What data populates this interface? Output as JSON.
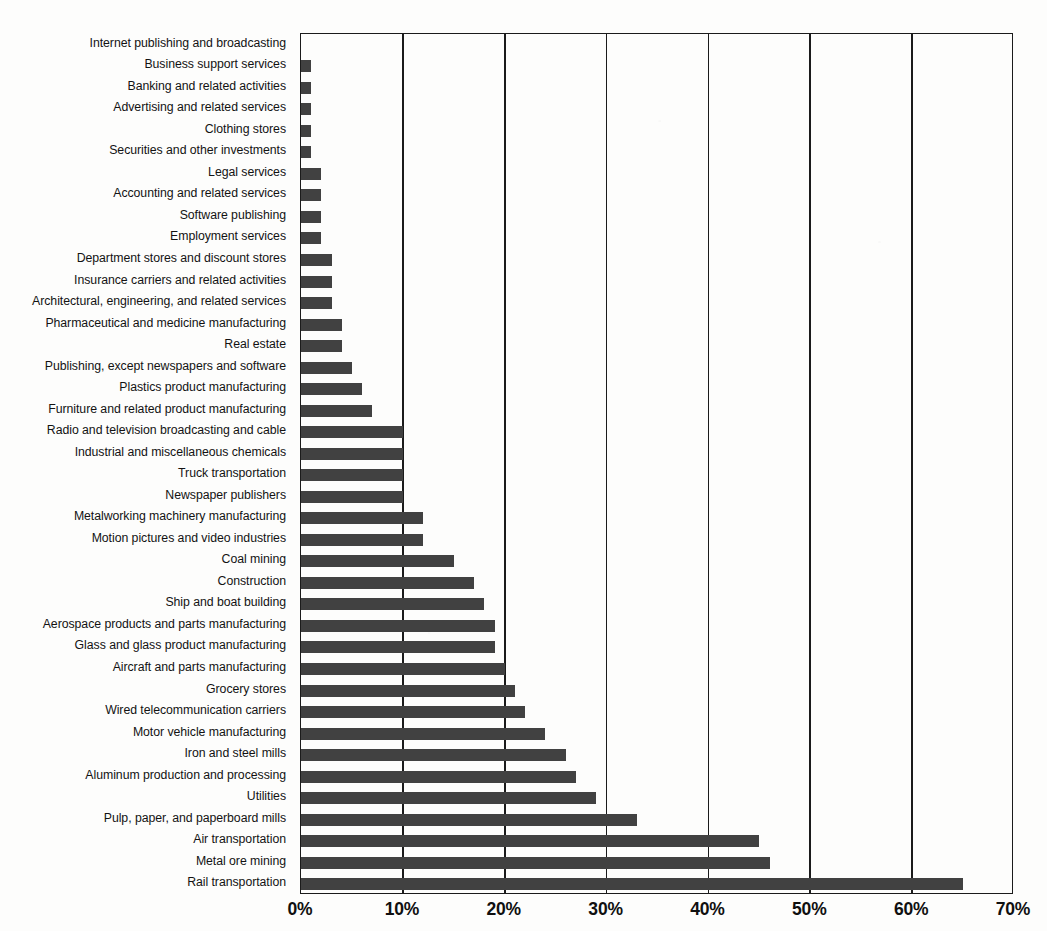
{
  "chart_data": {
    "type": "bar",
    "orientation": "horizontal",
    "title": "",
    "subtitle": "",
    "xlabel": "",
    "ylabel": "",
    "xlim": [
      0,
      70
    ],
    "ylim": null,
    "grid": true,
    "grid_axis": "x",
    "legend": null,
    "legend_position": "none",
    "value_unit": "percent",
    "xtick_labels": [
      "0%",
      "10%",
      "20%",
      "30%",
      "40%",
      "50%",
      "60%",
      "70%"
    ],
    "xtick_values": [
      0,
      10,
      20,
      30,
      40,
      50,
      60,
      70
    ],
    "bar_color": "#414141",
    "axis_color": "#1b1b1b",
    "background_color": "#fdfdfc",
    "categories": [
      "Internet publishing and broadcasting",
      "Business support services",
      "Banking and related activities",
      "Advertising and related services",
      "Clothing stores",
      "Securities and other investments",
      "Legal services",
      "Accounting and related services",
      "Software publishing",
      "Employment services",
      "Department stores and discount stores",
      "Insurance carriers and related activities",
      "Architectural, engineering, and related services",
      "Pharmaceutical and medicine manufacturing",
      "Real estate",
      "Publishing, except newspapers and software",
      "Plastics product manufacturing",
      "Furniture and related product manufacturing",
      "Radio and television broadcasting and cable",
      "Industrial and miscellaneous chemicals",
      "Truck transportation",
      "Newspaper publishers",
      "Metalworking machinery manufacturing",
      "Motion pictures and video industries",
      "Coal mining",
      "Construction",
      "Ship and boat building",
      "Aerospace products and parts manufacturing",
      "Glass and glass product manufacturing",
      "Aircraft and parts manufacturing",
      "Grocery stores",
      "Wired telecommunication carriers",
      "Motor vehicle manufacturing",
      "Iron and steel mills",
      "Aluminum production and processing",
      "Utilities",
      "Pulp, paper, and paperboard mills",
      "Air transportation",
      "Metal ore mining",
      "Rail transportation"
    ],
    "values": [
      0,
      1,
      1,
      1,
      1,
      1,
      2,
      2,
      2,
      2,
      3,
      3,
      3,
      4,
      4,
      5,
      6,
      7,
      10,
      10,
      10,
      10,
      12,
      12,
      15,
      17,
      18,
      19,
      19,
      20,
      21,
      22,
      24,
      26,
      27,
      29,
      33,
      45,
      46,
      65
    ]
  }
}
